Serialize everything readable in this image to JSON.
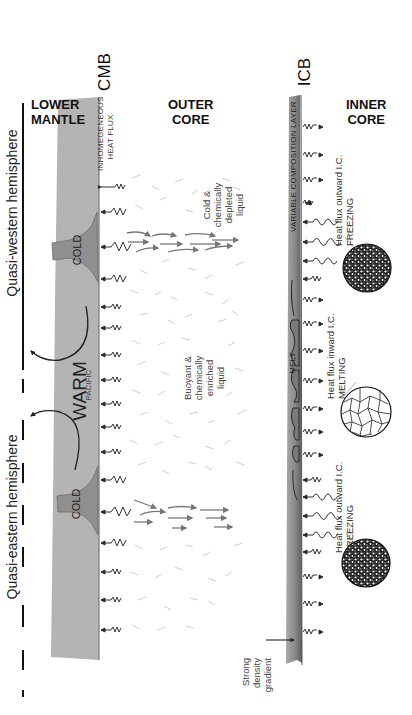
{
  "regions": {
    "lower_mantle": [
      "LOWER",
      "MANTLE"
    ],
    "outer_core": [
      "OUTER",
      "CORE"
    ],
    "inner_core": [
      "INNER",
      "CORE"
    ]
  },
  "boundaries": {
    "cmb": "CMB",
    "icb": "ICB"
  },
  "hemispheres": {
    "western": "Quasi-western hemisphere",
    "eastern": "Quasi-eastern hemisphere"
  },
  "mantle_labels": {
    "heat_flux": [
      "INHOMEGENEOUS",
      "HEAT FLUX"
    ],
    "cold_top": "COLD",
    "cold_bottom": "COLD",
    "warm": "WARM",
    "pacific": "PACIFIC"
  },
  "outer_core_labels": {
    "cold_liquid": [
      "Cold &",
      "chemically",
      "depleted",
      "liquid"
    ],
    "buoyant_liquid": [
      "Buoyant &",
      "chemically",
      "enriched",
      "liquid"
    ],
    "variable_layer": "VARIABLE COMPOSITION LAYER",
    "melt": "MELT",
    "density_gradient": [
      "Strong",
      "density",
      "gradient"
    ]
  },
  "inner_core_labels": {
    "freezing_top": [
      "Heat flux outward I.C.",
      "FREEZING"
    ],
    "melting": [
      "Heat flux inward I.C.",
      "MELTING"
    ],
    "freezing_bottom": [
      "Heat flux outward I.C.",
      "FREEZING"
    ]
  },
  "colors": {
    "mantle": "#b4b4b4",
    "mantle_cold": "#8f8f8f",
    "icb_layer_dark": "#6e6e6e",
    "icb_layer_light": "#a6a6a6",
    "arrows": "#7a7a7a",
    "flow_dots": "#bdbdbd",
    "ink": "#222222"
  }
}
